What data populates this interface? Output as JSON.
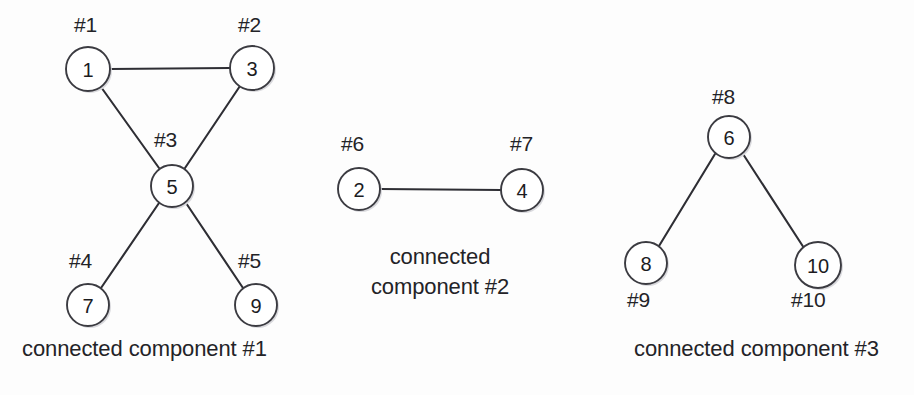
{
  "diagram": {
    "background_color": "#fdfdfd",
    "node_fill": "#ffffff",
    "node_stroke": "#3b3b41",
    "edge_color": "#2e2e34",
    "text_color": "#232327"
  },
  "nodes": [
    {
      "id": "n1",
      "label": "1",
      "index_label": "#1",
      "cx": 88,
      "cy": 69,
      "r": 22,
      "index_x": 74,
      "index_y": 14,
      "component": 1
    },
    {
      "id": "n3",
      "label": "3",
      "index_label": "#2",
      "cx": 252,
      "cy": 68,
      "r": 22,
      "index_x": 238,
      "index_y": 14,
      "component": 1
    },
    {
      "id": "n5",
      "label": "5",
      "index_label": "#3",
      "cx": 172,
      "cy": 186,
      "r": 21,
      "index_x": 154,
      "index_y": 130,
      "component": 1
    },
    {
      "id": "n7",
      "label": "7",
      "index_label": "#4",
      "cx": 88,
      "cy": 305,
      "r": 21,
      "index_x": 69,
      "index_y": 250,
      "component": 1
    },
    {
      "id": "n9",
      "label": "9",
      "index_label": "#5",
      "cx": 256,
      "cy": 305,
      "r": 21,
      "index_x": 238,
      "index_y": 250,
      "component": 1
    },
    {
      "id": "n2",
      "label": "2",
      "index_label": "#6",
      "cx": 359,
      "cy": 189,
      "r": 21,
      "index_x": 341,
      "index_y": 134,
      "component": 2
    },
    {
      "id": "n4",
      "label": "4",
      "index_label": "#7",
      "cx": 522,
      "cy": 190,
      "r": 21,
      "index_x": 510,
      "index_y": 134,
      "component": 2
    },
    {
      "id": "n6",
      "label": "6",
      "index_label": "#8",
      "cx": 729,
      "cy": 137,
      "r": 21,
      "index_x": 712,
      "index_y": 86,
      "component": 3
    },
    {
      "id": "n8",
      "label": "8",
      "index_label": "#9",
      "cx": 646,
      "cy": 263,
      "r": 21,
      "index_x": 627,
      "index_y": 290,
      "component": 3
    },
    {
      "id": "n10",
      "label": "10",
      "index_label": "#10",
      "cx": 818,
      "cy": 265,
      "r": 23,
      "index_x": 793,
      "index_y": 290,
      "component": 3
    }
  ],
  "edges": [
    {
      "from": "n1",
      "to": "n3",
      "component": 1
    },
    {
      "from": "n1",
      "to": "n5",
      "component": 1
    },
    {
      "from": "n3",
      "to": "n5",
      "component": 1
    },
    {
      "from": "n5",
      "to": "n7",
      "component": 1
    },
    {
      "from": "n5",
      "to": "n9",
      "component": 1
    },
    {
      "from": "n2",
      "to": "n4",
      "component": 2
    },
    {
      "from": "n6",
      "to": "n8",
      "component": 3
    },
    {
      "from": "n6",
      "to": "n10",
      "component": 3
    }
  ],
  "captions": [
    {
      "id": "c1",
      "text": "connected component #1",
      "x": 22,
      "y": 338,
      "lines": [
        "connected component #1"
      ]
    },
    {
      "id": "c2",
      "text": "connected component #2",
      "x": 352,
      "y": 246,
      "lines": [
        "connected",
        "component #2"
      ]
    },
    {
      "id": "c3",
      "text": "connected component #3",
      "x": 634,
      "y": 338,
      "lines": [
        "connected component #3"
      ]
    }
  ],
  "caption_text": {
    "component1": "connected component #1",
    "component2_line1": "connected",
    "component2_line2": "component #2",
    "component3": "connected component #3"
  },
  "node_labels": {
    "n1": "1",
    "n3": "3",
    "n5": "5",
    "n7": "7",
    "n9": "9",
    "n2": "2",
    "n4": "4",
    "n6": "6",
    "n8": "8",
    "n10": "10"
  },
  "index_labels": {
    "n1": "#1",
    "n3": "#2",
    "n5": "#3",
    "n7": "#4",
    "n9": "#5",
    "n2": "#6",
    "n4": "#7",
    "n6": "#8",
    "n8": "#9",
    "n10": "#10"
  }
}
